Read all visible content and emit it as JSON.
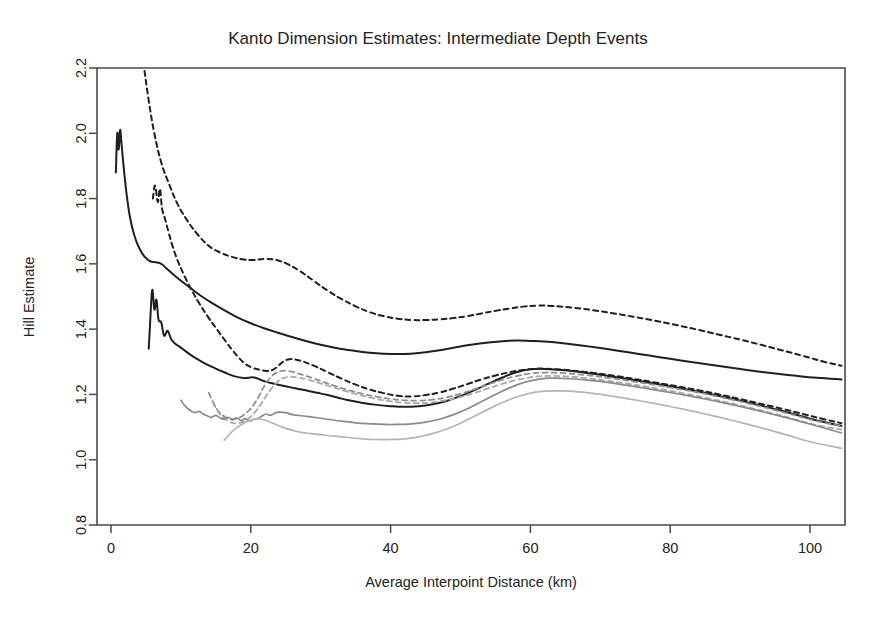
{
  "chart_data": {
    "type": "line",
    "title": "Kanto Dimension Estimates: Intermediate Depth Events",
    "xlabel": "Average Interpoint Distance (km)",
    "ylabel": "Hill Estimate",
    "xlim": [
      -2,
      105
    ],
    "ylim": [
      0.8,
      2.2
    ],
    "xticks": [
      0,
      20,
      40,
      60,
      80,
      100
    ],
    "xtick_labels": [
      "0",
      "20",
      "40",
      "60",
      "80",
      "100"
    ],
    "yticks": [
      0.8,
      1.0,
      1.2,
      1.4,
      1.6,
      1.8,
      2.0,
      2.2
    ],
    "ytick_labels": [
      "0.8",
      "1.0",
      "1.2",
      "1.4",
      "1.6",
      "1.8",
      "2.0",
      "2.2"
    ],
    "grid": false,
    "legend": "none",
    "series": [
      {
        "name": "black-dashed-upper",
        "color": "#1f1f1f",
        "style": "dashed",
        "width": 2.0,
        "x": [
          4.0,
          4.6,
          5.4,
          6.2,
          7.2,
          8.4,
          9.6,
          11.0,
          12.4,
          14.0,
          15.6,
          17.2,
          18.8,
          20.4,
          22.0,
          23.6,
          25.2,
          27.0,
          29.0,
          31.0,
          33.0,
          35.0,
          37.0,
          39.0,
          41.0,
          43.0,
          45.0,
          47.0,
          49.0,
          51.0,
          53.0,
          55.0,
          57.0,
          59.0,
          61.0,
          63.0,
          66.0,
          69.0,
          72.0,
          75.0,
          78.0,
          81.0,
          84.0,
          87.0,
          90.0,
          93.0,
          96.0,
          99.0,
          102.0,
          104.5
        ],
        "y": [
          2.3,
          2.22,
          2.1,
          2.0,
          1.91,
          1.84,
          1.78,
          1.73,
          1.69,
          1.655,
          1.635,
          1.622,
          1.614,
          1.612,
          1.615,
          1.612,
          1.6,
          1.578,
          1.548,
          1.518,
          1.492,
          1.47,
          1.452,
          1.44,
          1.432,
          1.428,
          1.428,
          1.43,
          1.434,
          1.44,
          1.448,
          1.456,
          1.463,
          1.469,
          1.472,
          1.471,
          1.466,
          1.458,
          1.448,
          1.437,
          1.425,
          1.412,
          1.398,
          1.383,
          1.368,
          1.352,
          1.335,
          1.318,
          1.3,
          1.288
        ]
      },
      {
        "name": "black-solid-upper",
        "color": "#1f1f1f",
        "style": "solid",
        "width": 2.0,
        "x": [
          0.7,
          0.9,
          1.1,
          1.3,
          1.5,
          1.8,
          2.2,
          2.7,
          3.3,
          4.0,
          4.8,
          5.6,
          6.4,
          7.2,
          8.0,
          9.0,
          10.2,
          11.6,
          13.0,
          14.6,
          16.2,
          18.0,
          20.0,
          22.0,
          24.0,
          26.0,
          28.0,
          30.0,
          32.0,
          34.0,
          36.0,
          38.0,
          40.0,
          42.0,
          44.0,
          46.0,
          48.0,
          50.0,
          52.0,
          54.0,
          56.0,
          58.0,
          60.0,
          62.0,
          65.0,
          68.0,
          71.0,
          74.0,
          77.0,
          80.0,
          83.0,
          86.0,
          89.0,
          92.0,
          95.0,
          98.0,
          101.0,
          104.5
        ],
        "y": [
          1.88,
          2.0,
          1.95,
          2.01,
          1.97,
          1.9,
          1.82,
          1.745,
          1.69,
          1.65,
          1.622,
          1.608,
          1.605,
          1.6,
          1.585,
          1.566,
          1.545,
          1.522,
          1.5,
          1.478,
          1.458,
          1.437,
          1.418,
          1.402,
          1.388,
          1.375,
          1.363,
          1.352,
          1.343,
          1.336,
          1.33,
          1.326,
          1.324,
          1.324,
          1.327,
          1.332,
          1.339,
          1.347,
          1.354,
          1.359,
          1.363,
          1.365,
          1.364,
          1.362,
          1.356,
          1.348,
          1.339,
          1.329,
          1.319,
          1.309,
          1.299,
          1.29,
          1.281,
          1.272,
          1.264,
          1.257,
          1.251,
          1.246
        ]
      },
      {
        "name": "black-dashed-lower",
        "color": "#1f1f1f",
        "style": "dashed",
        "width": 2.0,
        "x": [
          6.0,
          6.3,
          6.7,
          7.0,
          7.3,
          7.7,
          8.2,
          8.8,
          9.5,
          10.4,
          11.4,
          12.6,
          13.9,
          15.2,
          16.4,
          17.4,
          18.3,
          19.2,
          20.2,
          21.2,
          22.2,
          23.0,
          23.8,
          24.6,
          25.6,
          27.0,
          29.0,
          31.0,
          33.0,
          35.0,
          37.0,
          39.0,
          41.0,
          43.0,
          45.0,
          47.0,
          49.0,
          51.0,
          53.0,
          55.0,
          57.0,
          59.0,
          61.0,
          63.0,
          66.0,
          69.0,
          72.0,
          75.0,
          78.0,
          81.0,
          84.0,
          87.0,
          90.0,
          93.0,
          96.0,
          99.0,
          102.0,
          104.5
        ],
        "y": [
          1.8,
          1.84,
          1.79,
          1.83,
          1.77,
          1.74,
          1.7,
          1.655,
          1.612,
          1.568,
          1.525,
          1.48,
          1.437,
          1.398,
          1.363,
          1.335,
          1.312,
          1.294,
          1.282,
          1.276,
          1.272,
          1.274,
          1.285,
          1.3,
          1.308,
          1.304,
          1.288,
          1.268,
          1.248,
          1.23,
          1.215,
          1.204,
          1.196,
          1.194,
          1.198,
          1.206,
          1.218,
          1.232,
          1.246,
          1.258,
          1.268,
          1.275,
          1.279,
          1.278,
          1.273,
          1.266,
          1.257,
          1.247,
          1.236,
          1.225,
          1.213,
          1.2,
          1.186,
          1.171,
          1.156,
          1.14,
          1.124,
          1.112
        ]
      },
      {
        "name": "black-solid-lower",
        "color": "#1f1f1f",
        "style": "solid",
        "width": 2.0,
        "x": [
          5.4,
          5.6,
          5.9,
          6.2,
          6.5,
          6.8,
          7.2,
          7.6,
          8.1,
          8.6,
          9.2,
          9.9,
          10.7,
          11.6,
          12.6,
          13.7,
          14.9,
          16.2,
          17.6,
          19.0,
          20.5,
          22.0,
          23.5,
          25.0,
          26.5,
          28.0,
          29.5,
          31.0,
          32.5,
          34.0,
          36.0,
          38.0,
          40.0,
          42.0,
          44.0,
          46.0,
          48.0,
          50.0,
          52.0,
          54.0,
          56.0,
          58.0,
          60.0,
          62.0,
          65.0,
          68.0,
          71.0,
          74.0,
          77.0,
          80.0,
          83.0,
          86.0,
          89.0,
          92.0,
          95.0,
          98.0,
          101.0,
          104.5
        ],
        "y": [
          1.34,
          1.42,
          1.52,
          1.46,
          1.49,
          1.43,
          1.42,
          1.38,
          1.395,
          1.37,
          1.355,
          1.345,
          1.332,
          1.318,
          1.305,
          1.292,
          1.28,
          1.268,
          1.256,
          1.25,
          1.252,
          1.24,
          1.232,
          1.225,
          1.218,
          1.212,
          1.205,
          1.198,
          1.19,
          1.182,
          1.174,
          1.168,
          1.164,
          1.162,
          1.164,
          1.17,
          1.18,
          1.195,
          1.213,
          1.233,
          1.252,
          1.268,
          1.277,
          1.278,
          1.274,
          1.266,
          1.257,
          1.247,
          1.236,
          1.225,
          1.213,
          1.2,
          1.186,
          1.171,
          1.155,
          1.138,
          1.12,
          1.104
        ]
      },
      {
        "name": "gray-dashed-upper",
        "color": "#8f8f8f",
        "style": "dashed",
        "width": 1.8,
        "x": [
          14.0,
          14.4,
          14.9,
          15.4,
          16.0,
          16.6,
          17.3,
          18.0,
          18.8,
          19.6,
          20.4,
          21.2,
          22.0,
          22.8,
          23.6,
          24.4,
          25.2,
          26.2,
          27.4,
          28.8,
          30.4,
          32.0,
          34.0,
          36.0,
          38.0,
          40.0,
          42.0,
          44.0,
          46.0,
          48.0,
          50.0,
          52.0,
          54.0,
          56.0,
          58.0,
          60.0,
          62.0,
          65.0,
          68.0,
          71.0,
          74.0,
          77.0,
          80.0,
          83.0,
          86.0,
          89.0,
          92.0,
          95.0,
          98.0,
          101.0,
          104.5
        ],
        "y": [
          1.205,
          1.185,
          1.165,
          1.148,
          1.136,
          1.128,
          1.124,
          1.126,
          1.134,
          1.148,
          1.168,
          1.196,
          1.228,
          1.252,
          1.266,
          1.272,
          1.272,
          1.268,
          1.26,
          1.25,
          1.238,
          1.226,
          1.213,
          1.202,
          1.193,
          1.186,
          1.182,
          1.181,
          1.184,
          1.191,
          1.202,
          1.216,
          1.231,
          1.245,
          1.256,
          1.264,
          1.267,
          1.265,
          1.259,
          1.251,
          1.242,
          1.232,
          1.221,
          1.21,
          1.197,
          1.183,
          1.168,
          1.152,
          1.135,
          1.118,
          1.103
        ]
      },
      {
        "name": "gray-dashed-lower",
        "color": "#a8a8a8",
        "style": "dashed",
        "width": 1.8,
        "x": [
          14.6,
          15.0,
          15.5,
          16.1,
          16.8,
          17.5,
          18.3,
          19.1,
          19.9,
          20.7,
          21.5,
          22.3,
          23.1,
          23.9,
          24.7,
          25.6,
          26.8,
          28.2,
          29.8,
          31.6,
          33.6,
          35.6,
          37.6,
          39.6,
          41.6,
          43.6,
          45.6,
          47.6,
          49.6,
          51.6,
          53.6,
          55.6,
          57.6,
          59.6,
          61.6,
          64.5,
          67.5,
          70.5,
          73.5,
          76.5,
          79.5,
          82.5,
          85.5,
          88.5,
          91.5,
          94.5,
          97.5,
          100.5,
          104.5
        ],
        "y": [
          1.175,
          1.158,
          1.142,
          1.128,
          1.118,
          1.112,
          1.112,
          1.118,
          1.13,
          1.148,
          1.172,
          1.198,
          1.222,
          1.24,
          1.25,
          1.254,
          1.252,
          1.245,
          1.235,
          1.223,
          1.21,
          1.198,
          1.188,
          1.18,
          1.175,
          1.173,
          1.175,
          1.181,
          1.19,
          1.202,
          1.216,
          1.23,
          1.242,
          1.251,
          1.256,
          1.256,
          1.251,
          1.243,
          1.234,
          1.224,
          1.213,
          1.201,
          1.188,
          1.174,
          1.159,
          1.143,
          1.126,
          1.108,
          1.092
        ]
      },
      {
        "name": "gray-solid-upper",
        "color": "#8a8a8a",
        "style": "solid",
        "width": 1.7,
        "x": [
          10.0,
          10.4,
          10.9,
          11.4,
          12.0,
          12.6,
          13.2,
          13.8,
          14.4,
          15.0,
          15.6,
          16.2,
          16.8,
          17.4,
          18.0,
          18.6,
          19.2,
          19.8,
          20.4,
          21.0,
          21.6,
          22.2,
          22.8,
          23.4,
          24.0,
          25.0,
          26.0,
          27.5,
          29.0,
          31.0,
          33.0,
          35.0,
          37.0,
          39.0,
          41.0,
          43.0,
          45.0,
          47.0,
          49.0,
          51.0,
          53.0,
          55.0,
          57.0,
          59.0,
          61.0,
          63.0,
          66.0,
          69.0,
          72.0,
          75.0,
          78.0,
          81.0,
          84.0,
          87.0,
          90.0,
          93.0,
          96.0,
          99.0,
          102.0,
          104.5
        ],
        "y": [
          1.182,
          1.17,
          1.158,
          1.15,
          1.144,
          1.148,
          1.14,
          1.134,
          1.13,
          1.136,
          1.128,
          1.124,
          1.13,
          1.122,
          1.128,
          1.12,
          1.126,
          1.118,
          1.124,
          1.126,
          1.134,
          1.14,
          1.136,
          1.142,
          1.146,
          1.144,
          1.138,
          1.134,
          1.13,
          1.124,
          1.118,
          1.113,
          1.11,
          1.108,
          1.108,
          1.11,
          1.115,
          1.124,
          1.138,
          1.156,
          1.178,
          1.2,
          1.22,
          1.236,
          1.246,
          1.25,
          1.248,
          1.242,
          1.234,
          1.224,
          1.213,
          1.202,
          1.19,
          1.177,
          1.163,
          1.148,
          1.132,
          1.115,
          1.097,
          1.082
        ]
      },
      {
        "name": "gray-solid-lower",
        "color": "#b5b5b5",
        "style": "solid",
        "width": 1.7,
        "x": [
          16.2,
          16.7,
          17.3,
          18.0,
          18.7,
          19.4,
          20.1,
          20.8,
          21.5,
          22.2,
          22.9,
          23.6,
          24.3,
          25.0,
          26.0,
          27.2,
          28.6,
          30.2,
          32.0,
          34.0,
          36.0,
          38.0,
          40.0,
          42.0,
          44.0,
          46.0,
          48.0,
          50.0,
          52.0,
          54.0,
          56.0,
          58.0,
          60.0,
          62.0,
          64.0,
          67.0,
          70.0,
          73.0,
          76.0,
          79.0,
          82.0,
          85.0,
          88.0,
          91.0,
          94.0,
          97.0,
          100.0,
          104.5
        ],
        "y": [
          1.06,
          1.072,
          1.086,
          1.098,
          1.108,
          1.116,
          1.122,
          1.126,
          1.124,
          1.12,
          1.114,
          1.108,
          1.102,
          1.096,
          1.09,
          1.084,
          1.08,
          1.076,
          1.072,
          1.068,
          1.064,
          1.062,
          1.062,
          1.064,
          1.07,
          1.08,
          1.094,
          1.112,
          1.133,
          1.155,
          1.175,
          1.192,
          1.204,
          1.21,
          1.211,
          1.208,
          1.2,
          1.19,
          1.179,
          1.167,
          1.154,
          1.14,
          1.125,
          1.109,
          1.092,
          1.074,
          1.055,
          1.035
        ]
      }
    ]
  },
  "figure": {
    "background": "#ffffff",
    "frame_color": "#4a4a4a",
    "text_color": "#232323"
  }
}
